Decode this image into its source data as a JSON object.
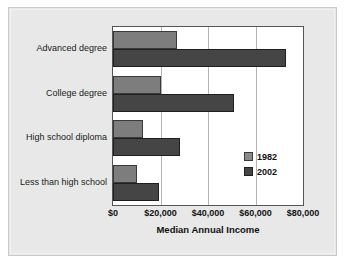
{
  "chart_data": {
    "type": "bar",
    "orientation": "horizontal",
    "title": "",
    "xlabel": "Median Annual Income",
    "ylabel": "",
    "categories": [
      "Advanced degree",
      "College degree",
      "High school diploma",
      "Less than high school"
    ],
    "series": [
      {
        "name": "1982",
        "color": "#7d7d7d",
        "values": [
          27000,
          20000,
          12500,
          10000
        ]
      },
      {
        "name": "2002",
        "color": "#454545",
        "values": [
          73000,
          51000,
          28000,
          19500
        ]
      }
    ],
    "xlim": [
      0,
      80000
    ],
    "xticks": [
      0,
      20000,
      40000,
      60000,
      80000
    ],
    "xtick_labels": [
      "$0",
      "$20,000",
      "$40,000",
      "$60,000",
      "$80,000"
    ],
    "grid": true,
    "legend_position": "inside-right",
    "background_color": "#e8e8e8",
    "plot_background_color": "#ffffff"
  }
}
